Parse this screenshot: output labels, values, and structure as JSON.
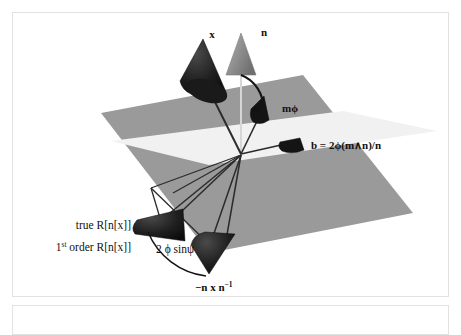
{
  "figure": {
    "caption_box_present": true,
    "geometry": {
      "origin": {
        "x": 228,
        "y": 140
      },
      "plane_dark_color": "#9a9a9a",
      "plane_light_color": "#f1f1f1",
      "cone_dark_color": "#1d1d1d",
      "cone_gray_color": "#8d8d8d",
      "line_color": "#2b2b2b",
      "axis_line_color": "#d4d4d4"
    },
    "labels": {
      "x_vector": "x",
      "n_vector": "n",
      "psi_angle": "ψ",
      "m_phi": "mϕ",
      "b_formula": "b = 2ϕ(m∧n)/n",
      "true_rotation": "true R[n[x]]",
      "first_order_prefix": "1",
      "first_order_superscript": "st",
      "first_order_rest": " order R[n[x]]",
      "two_phi_sin_psi": "2 ϕ sinψ",
      "minus_n_x_n_inv_main": "−n x n",
      "minus_n_x_n_inv_sup": "−1"
    }
  },
  "colors": {
    "panel_border": "#e2e2e2",
    "background": "#ffffff",
    "text": "#111111"
  }
}
